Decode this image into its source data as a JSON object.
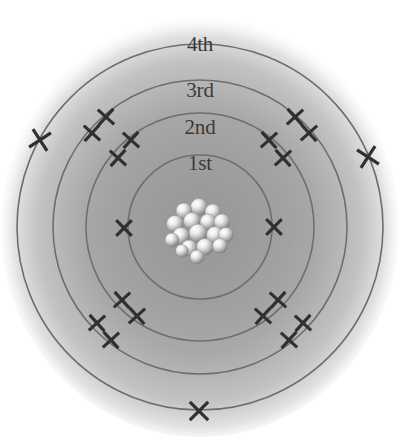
{
  "diagram": {
    "type": "atomic-shell-diagram",
    "canvas": {
      "width": 403,
      "height": 444
    },
    "center": {
      "x": 200,
      "y": 227
    },
    "background_color": "#ffffff",
    "ring_color": "#6e6e6e",
    "mark_color": "#303030",
    "label_color": "#3a3a3a",
    "halo_color": "#b3b3b3"
  },
  "shells": [
    {
      "index": 1,
      "label": "1st",
      "radius": 72,
      "label_pos": {
        "x": 200,
        "y": 163
      },
      "mark_shape": "x",
      "electron_count": 2
    },
    {
      "index": 2,
      "label": "2nd",
      "radius": 114,
      "label_pos": {
        "x": 200,
        "y": 127
      },
      "mark_shape": "plus",
      "electron_count": 8
    },
    {
      "index": 3,
      "label": "3rd",
      "radius": 147,
      "label_pos": {
        "x": 200,
        "y": 90
      },
      "mark_shape": "plus",
      "electron_count": 8
    },
    {
      "index": 4,
      "label": "4th",
      "radius": 183,
      "label_pos": {
        "x": 200,
        "y": 44
      },
      "mark_shape": "x",
      "electron_count": 3
    }
  ],
  "electrons": [
    {
      "shell": 1,
      "shape": "x",
      "x": 124,
      "y": 228,
      "size": 11,
      "rot": 0
    },
    {
      "shell": 1,
      "shape": "x",
      "x": 274,
      "y": 227,
      "size": 11,
      "rot": 0
    },
    {
      "shell": 2,
      "shape": "plus",
      "x": 131,
      "y": 140,
      "size": 11,
      "rot": 42
    },
    {
      "shell": 2,
      "shape": "plus",
      "x": 118,
      "y": 158,
      "size": 11,
      "rot": 42
    },
    {
      "shell": 2,
      "shape": "plus",
      "x": 269,
      "y": 140,
      "size": 11,
      "rot": -42
    },
    {
      "shell": 2,
      "shape": "plus",
      "x": 283,
      "y": 158,
      "size": 11,
      "rot": -42
    },
    {
      "shell": 2,
      "shape": "plus",
      "x": 122,
      "y": 300,
      "size": 11,
      "rot": -42
    },
    {
      "shell": 2,
      "shape": "plus",
      "x": 137,
      "y": 316,
      "size": 11,
      "rot": -42
    },
    {
      "shell": 2,
      "shape": "plus",
      "x": 278,
      "y": 300,
      "size": 11,
      "rot": 42
    },
    {
      "shell": 2,
      "shape": "plus",
      "x": 263,
      "y": 316,
      "size": 11,
      "rot": 42
    },
    {
      "shell": 3,
      "shape": "plus",
      "x": 106,
      "y": 117,
      "size": 11,
      "rot": 42
    },
    {
      "shell": 3,
      "shape": "plus",
      "x": 92,
      "y": 133,
      "size": 11,
      "rot": 42
    },
    {
      "shell": 3,
      "shape": "plus",
      "x": 295,
      "y": 117,
      "size": 11,
      "rot": -42
    },
    {
      "shell": 3,
      "shape": "plus",
      "x": 309,
      "y": 133,
      "size": 11,
      "rot": -42
    },
    {
      "shell": 3,
      "shape": "plus",
      "x": 97,
      "y": 323,
      "size": 11,
      "rot": -42
    },
    {
      "shell": 3,
      "shape": "plus",
      "x": 111,
      "y": 340,
      "size": 11,
      "rot": -42
    },
    {
      "shell": 3,
      "shape": "plus",
      "x": 303,
      "y": 323,
      "size": 11,
      "rot": 42
    },
    {
      "shell": 3,
      "shape": "plus",
      "x": 289,
      "y": 340,
      "size": 11,
      "rot": 42
    },
    {
      "shell": 4,
      "shape": "x",
      "x": 40,
      "y": 140,
      "size": 13,
      "rot": 12
    },
    {
      "shell": 4,
      "shape": "x",
      "x": 368,
      "y": 157,
      "size": 13,
      "rot": -12
    },
    {
      "shell": 4,
      "shape": "x",
      "x": 199,
      "y": 411,
      "size": 13,
      "rot": 0
    }
  ],
  "nucleus": {
    "name": "nucleus",
    "center": {
      "x": 199,
      "y": 228
    },
    "radius": 26,
    "particle_count": 17,
    "particles": [
      {
        "x": 199,
        "y": 207,
        "r": 8.5
      },
      {
        "x": 184,
        "y": 211,
        "r": 8.0
      },
      {
        "x": 213,
        "y": 212,
        "r": 8.0
      },
      {
        "x": 175,
        "y": 224,
        "r": 8.5
      },
      {
        "x": 192,
        "y": 221,
        "r": 8.5
      },
      {
        "x": 208,
        "y": 222,
        "r": 8.0
      },
      {
        "x": 222,
        "y": 222,
        "r": 8.0
      },
      {
        "x": 181,
        "y": 236,
        "r": 8.5
      },
      {
        "x": 198,
        "y": 233,
        "r": 9.0
      },
      {
        "x": 215,
        "y": 235,
        "r": 8.5
      },
      {
        "x": 226,
        "y": 235,
        "r": 7.5
      },
      {
        "x": 172,
        "y": 240,
        "r": 7.0
      },
      {
        "x": 189,
        "y": 248,
        "r": 8.0
      },
      {
        "x": 205,
        "y": 247,
        "r": 8.5
      },
      {
        "x": 220,
        "y": 246,
        "r": 7.5
      },
      {
        "x": 197,
        "y": 257,
        "r": 7.0
      },
      {
        "x": 182,
        "y": 251,
        "r": 6.5
      }
    ]
  }
}
